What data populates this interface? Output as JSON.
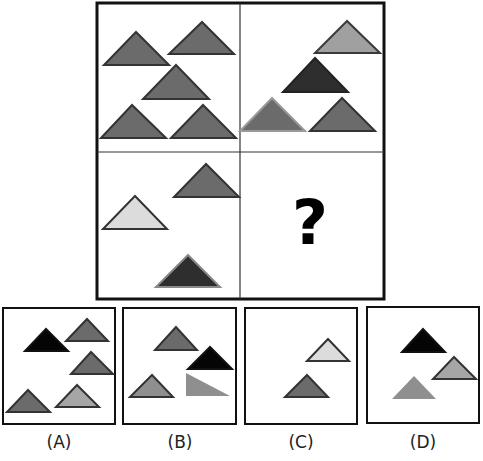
{
  "puzzle": {
    "question_mark": "?",
    "colors": {
      "border": "#111111",
      "medium": "#6b6b6b",
      "dark": "#2e2e2e",
      "black": "#050505",
      "light": "#a6a6a6",
      "pale": "#dcdcdc",
      "grid_line": "#333333"
    },
    "grid": {
      "panels": [
        {
          "id": "top-left",
          "triangles": [
            {
              "points": "136,32 104,65 169,65",
              "fill": "#6b6b6b",
              "stroke": "#333333"
            },
            {
              "points": "202,22 169,54 234,54",
              "fill": "#6b6b6b",
              "stroke": "#333333"
            },
            {
              "points": "176,65 143,99 209,99",
              "fill": "#6b6b6b",
              "stroke": "#333333"
            },
            {
              "points": "132,105 101,138 166,138",
              "fill": "#6b6b6b",
              "stroke": "#333333"
            },
            {
              "points": "203,105 171,138 236,138",
              "fill": "#6b6b6b",
              "stroke": "#333333"
            }
          ]
        },
        {
          "id": "top-right",
          "triangles": [
            {
              "points": "347,21 315,53 380,53",
              "fill": "#a0a0a0",
              "stroke": "#3a3a3a"
            },
            {
              "points": "315,58 283,92 348,92",
              "fill": "#2e2e2e",
              "stroke": "#222222"
            },
            {
              "points": "272,98 240,131 305,131",
              "fill": "#6b6b6b",
              "stroke": "#9a9a9a"
            },
            {
              "points": "342,98 310,131 375,131",
              "fill": "#6b6b6b",
              "stroke": "#333333"
            }
          ]
        },
        {
          "id": "bottom-left",
          "triangles": [
            {
              "points": "206,164 174,197 239,197",
              "fill": "#6b6b6b",
              "stroke": "#333333"
            },
            {
              "points": "135,196 103,229 167,229",
              "fill": "#dcdcdc",
              "stroke": "#333333"
            },
            {
              "points": "188,255 156,287 220,287",
              "fill": "#2e2e2e",
              "stroke": "#8a8a8a"
            }
          ]
        },
        {
          "id": "bottom-right",
          "triangles": []
        }
      ]
    },
    "options": [
      {
        "label": "(A)",
        "triangles": [
          {
            "points": "46,329 25,351 68,351",
            "fill": "#050505",
            "stroke": "#111111"
          },
          {
            "points": "87,319 66,341 108,341",
            "fill": "#6b6b6b",
            "stroke": "#333333"
          },
          {
            "points": "91,352 71,374 113,374",
            "fill": "#6b6b6b",
            "stroke": "#333333"
          },
          {
            "points": "28,390 7,412 50,412",
            "fill": "#6b6b6b",
            "stroke": "#333333"
          },
          {
            "points": "77,385 56,407 99,407",
            "fill": "#a6a6a6",
            "stroke": "#333333"
          }
        ]
      },
      {
        "label": "(B)",
        "triangles": [
          {
            "points": "176,327 155,350 197,350",
            "fill": "#6b6b6b",
            "stroke": "#333333"
          },
          {
            "points": "210,347 188,369 232,369",
            "fill": "#050505",
            "stroke": "#111111"
          },
          {
            "points": "152,375 130,397 173,397",
            "fill": "#8f8f8f",
            "stroke": "#333333"
          },
          {
            "points": "186,373 186,396 230,396",
            "fill": "#8f8f8f",
            "stroke": "none"
          }
        ]
      },
      {
        "label": "(C)",
        "triangles": [
          {
            "points": "328,339 307,361 349,361",
            "fill": "#dcdcdc",
            "stroke": "#333333"
          },
          {
            "points": "307,375 285,397 328,397",
            "fill": "#6b6b6b",
            "stroke": "#333333"
          }
        ]
      },
      {
        "label": "(D)",
        "triangles": [
          {
            "points": "423,329 402,352 445,352",
            "fill": "#050505",
            "stroke": "#111111"
          },
          {
            "points": "454,357 433,379 476,379",
            "fill": "#a6a6a6",
            "stroke": "#333333"
          },
          {
            "points": "414,376 392,399 436,399",
            "fill": "#8f8f8f",
            "stroke": "none"
          }
        ]
      }
    ]
  }
}
